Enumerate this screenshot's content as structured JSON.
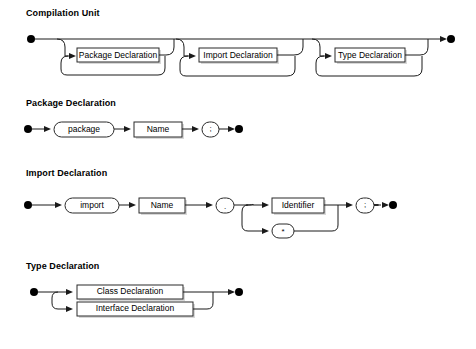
{
  "document": {
    "type": "railroad-syntax-diagram",
    "background_color": "#ffffff",
    "line_color": "#1a1a1a",
    "box_fill": "#ffffff"
  },
  "sections": [
    {
      "heading": "Compilation Unit",
      "nodes": [
        {
          "label": "Package Declaration",
          "shape": "rect"
        },
        {
          "label": "Import Declaration",
          "shape": "rect"
        },
        {
          "label": "Type Declaration",
          "shape": "rect"
        }
      ]
    },
    {
      "heading": "Package Declaration",
      "nodes": [
        {
          "label": "package",
          "shape": "oval"
        },
        {
          "label": "Name",
          "shape": "rect"
        },
        {
          "label": ";",
          "shape": "oval"
        }
      ]
    },
    {
      "heading": "Import Declaration",
      "nodes": [
        {
          "label": "import",
          "shape": "oval"
        },
        {
          "label": "Name",
          "shape": "rect"
        },
        {
          "label": ".",
          "shape": "oval"
        },
        {
          "label": "Identifier",
          "shape": "rect"
        },
        {
          "label": "*",
          "shape": "oval"
        },
        {
          "label": ";",
          "shape": "oval"
        }
      ]
    },
    {
      "heading": "Type Declaration",
      "nodes": [
        {
          "label": "Class Declaration",
          "shape": "rect"
        },
        {
          "label": "Interface Declaration",
          "shape": "rect"
        }
      ]
    }
  ]
}
